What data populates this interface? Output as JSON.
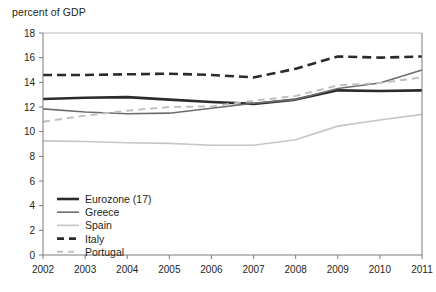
{
  "chart_data": {
    "type": "line",
    "title": "percent of GDP",
    "xlabel": "",
    "ylabel": "percent of GDP",
    "ylim": [
      0,
      18
    ],
    "ytick_step": 2,
    "grid": false,
    "legend_position": "inner-bottom-left",
    "x": [
      2002,
      2003,
      2004,
      2005,
      2006,
      2007,
      2008,
      2009,
      2010,
      2011
    ],
    "categories": [
      "2002",
      "2003",
      "2004",
      "2005",
      "2006",
      "2007",
      "2008",
      "2009",
      "2010",
      "2011"
    ],
    "yticks": [
      "18",
      "16",
      "14",
      "12",
      "10",
      "8",
      "6",
      "4",
      "2",
      "0"
    ],
    "series": [
      {
        "name": "Eurozone (17)",
        "style": "solid",
        "color": "#2b2b2b",
        "width": 2.6,
        "values": [
          12.65,
          12.75,
          12.8,
          12.6,
          12.4,
          12.25,
          12.6,
          13.35,
          13.3,
          13.35
        ]
      },
      {
        "name": "Greece",
        "style": "solid",
        "color": "#6d6d6d",
        "width": 1.6,
        "values": [
          11.85,
          11.6,
          11.45,
          11.5,
          11.9,
          12.3,
          12.6,
          13.5,
          13.95,
          15.0
        ]
      },
      {
        "name": "Spain",
        "style": "solid",
        "color": "#c6c6c6",
        "width": 1.6,
        "values": [
          9.25,
          9.2,
          9.1,
          9.05,
          8.9,
          8.9,
          9.35,
          10.45,
          10.95,
          11.4
        ]
      },
      {
        "name": "Italy",
        "style": "dashed",
        "color": "#2b2b2b",
        "width": 2.6,
        "values": [
          14.6,
          14.6,
          14.65,
          14.7,
          14.6,
          14.4,
          15.1,
          16.1,
          16.0,
          16.1
        ]
      },
      {
        "name": "Portugal",
        "style": "dashed",
        "color": "#c0c0c0",
        "width": 2.0,
        "values": [
          10.8,
          11.3,
          11.7,
          12.0,
          12.05,
          12.5,
          12.9,
          13.75,
          13.95,
          14.4
        ]
      }
    ]
  },
  "legend": {
    "items": [
      {
        "label": "Eurozone (17)"
      },
      {
        "label": "Greece"
      },
      {
        "label": "Spain"
      },
      {
        "label": "Italy"
      },
      {
        "label": "Portugal"
      }
    ]
  },
  "colors": {
    "eurozone": "#2b2b2b",
    "greece": "#6d6d6d",
    "spain": "#c6c6c6",
    "italy": "#2b2b2b",
    "portugal": "#c0c0c0",
    "axis": "#7d7d7d",
    "text": "#231f20",
    "background": "#ffffff"
  }
}
